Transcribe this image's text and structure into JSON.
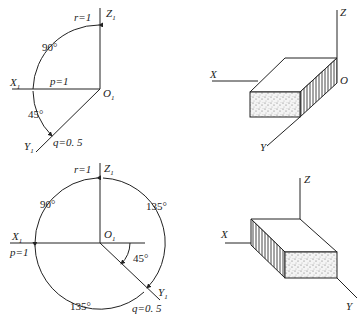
{
  "panels": {
    "top_left": {
      "axes": {
        "z": "Z",
        "x": "X",
        "y": "Y",
        "subscript": "1",
        "origin": "O"
      },
      "labels": {
        "r": "r=1",
        "p": "p=1",
        "q": "q=0. 5"
      },
      "angles": {
        "zx": "90°",
        "xy": "45°"
      }
    },
    "top_right": {
      "axes": {
        "z": "Z",
        "x": "X",
        "y": "Y",
        "origin": "O"
      }
    },
    "bottom_left": {
      "axes": {
        "z": "Z",
        "x": "X",
        "y": "Y",
        "subscript": "1",
        "origin": "O"
      },
      "labels": {
        "r": "r=1",
        "p": "p=1",
        "q": "q=0. 5"
      },
      "angles": {
        "zx": "90°",
        "zy": "135°",
        "xy_bottom": "135°",
        "y_horizontal": "45°"
      }
    },
    "bottom_right": {
      "axes": {
        "z": "Z",
        "x": "X",
        "y": "Y"
      }
    }
  }
}
